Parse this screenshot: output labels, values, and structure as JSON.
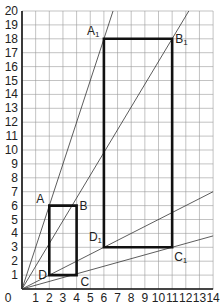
{
  "figure": {
    "title": "",
    "type": "enlargement / homothety on grid",
    "axes": {
      "x_ticks": [
        "0",
        "1",
        "2",
        "3",
        "4",
        "5",
        "6",
        "7",
        "8",
        "9",
        "10",
        "11",
        "12",
        "13",
        "14"
      ],
      "y_ticks": [
        "0",
        "1",
        "2",
        "3",
        "4",
        "5",
        "6",
        "7",
        "8",
        "9",
        "10",
        "11",
        "12",
        "13",
        "14",
        "15",
        "16",
        "17",
        "18",
        "19",
        "20"
      ],
      "xlim": [
        0,
        14
      ],
      "ylim": [
        0,
        20
      ],
      "grid": true
    },
    "small_rectangle": {
      "name": "ABCD",
      "vertices": [
        {
          "label": "A",
          "x": 2,
          "y": 6
        },
        {
          "label": "B",
          "x": 4,
          "y": 6
        },
        {
          "label": "C",
          "x": 4,
          "y": 1
        },
        {
          "label": "D",
          "x": 2,
          "y": 1
        }
      ]
    },
    "large_rectangle": {
      "name": "A1B1C1D1",
      "vertices": [
        {
          "label": "A",
          "sub": "1",
          "x": 6,
          "y": 18
        },
        {
          "label": "B",
          "sub": "1",
          "x": 11,
          "y": 18
        },
        {
          "label": "C",
          "sub": "1",
          "x": 11,
          "y": 3
        },
        {
          "label": "D",
          "sub": "1",
          "x": 6,
          "y": 3
        }
      ]
    },
    "rays_from_origin": [
      {
        "through": "A1",
        "to": [
          6.67,
          20
        ]
      },
      {
        "through": "B1",
        "to": [
          12.22,
          20
        ]
      },
      {
        "through": "D1",
        "to": [
          14,
          7
        ]
      },
      {
        "through": "C1",
        "to": [
          14,
          3.82
        ]
      }
    ],
    "colors": {
      "grid": "#9a9a9a",
      "axis": "#111111",
      "rect": "#111111",
      "ray": "#333333",
      "label": "#222222"
    }
  }
}
